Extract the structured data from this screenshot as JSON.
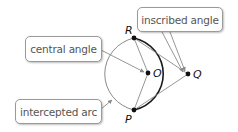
{
  "diagram": {
    "labels": {
      "inscribed_angle": "inscribed angle",
      "central_angle": "central angle",
      "intercepted_arc": "intercepted arc"
    },
    "points": {
      "R": "R",
      "O": "O",
      "Q": "Q",
      "P": "P"
    },
    "colors": {
      "bold_arc": "#1a1a1a",
      "thin_arc": "#8a8a8a",
      "segments": "#8a8a8a",
      "arrows": "#8a8a8a",
      "label_border": "#9a9a9a",
      "label_text": "#555555"
    }
  }
}
